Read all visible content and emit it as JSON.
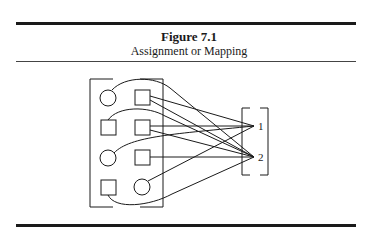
{
  "figure": {
    "number_label": "Figure 7.1",
    "caption": "Assignment or Mapping"
  },
  "diagram": {
    "domain_elements": [
      {
        "id": "a",
        "shape": "circle",
        "row": 1,
        "col": 1,
        "maps_to": "2"
      },
      {
        "id": "b",
        "shape": "square",
        "row": 1,
        "col": 2,
        "maps_to": "2"
      },
      {
        "id": "c",
        "shape": "square",
        "row": 2,
        "col": 1,
        "maps_to": "2"
      },
      {
        "id": "d",
        "shape": "square",
        "row": 2,
        "col": 2,
        "maps_to": "2"
      },
      {
        "id": "e",
        "shape": "circle",
        "row": 3,
        "col": 1,
        "maps_to": "1"
      },
      {
        "id": "f",
        "shape": "square",
        "row": 3,
        "col": 2,
        "maps_to": "2"
      },
      {
        "id": "g",
        "shape": "square",
        "row": 4,
        "col": 1,
        "maps_to": "2"
      },
      {
        "id": "h",
        "shape": "circle",
        "row": 4,
        "col": 2,
        "maps_to": "1"
      }
    ],
    "codomain_labels": [
      "1",
      "2"
    ],
    "line_color": "#1a1a1a"
  }
}
